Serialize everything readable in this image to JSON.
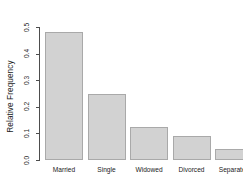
{
  "chart_data": {
    "type": "bar",
    "title": "",
    "subtitle": "",
    "xlabel": "",
    "ylabel": "Relative Frequency",
    "categories": [
      "Married",
      "Single",
      "Widowed",
      "Divorced",
      "Separated"
    ],
    "values": [
      0.48,
      0.25,
      0.125,
      0.09,
      0.04
    ],
    "ylim": [
      0.0,
      0.5
    ],
    "yticks": [
      0.0,
      0.1,
      0.2,
      0.3,
      0.4,
      0.5
    ],
    "ytick_labels": [
      "0.0",
      "0.1",
      "0.2",
      "0.3",
      "0.4",
      "0.5"
    ],
    "grid": false,
    "legend": null,
    "bar_fill_color": "#d2d2d2",
    "bar_border_color": "#a9a9a9",
    "axis_color": "#4d4d4d",
    "background_color": "#ffffff"
  }
}
